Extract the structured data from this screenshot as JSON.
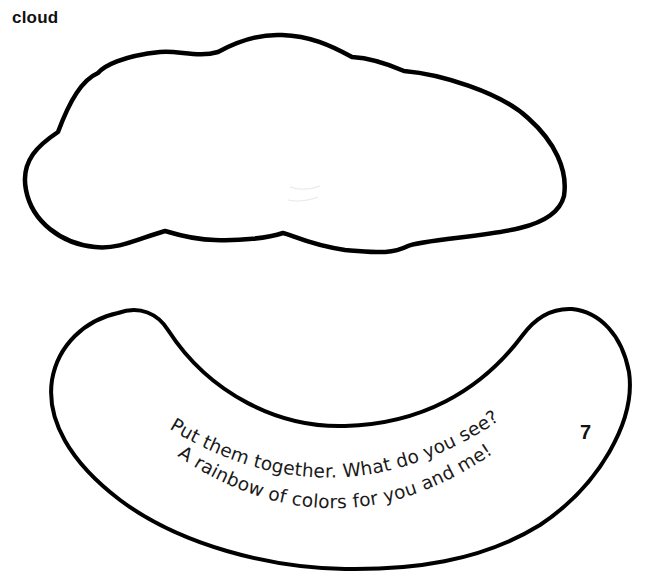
{
  "header": {
    "label": "cloud"
  },
  "pieces": {
    "cloud": {
      "name": "cloud cutout",
      "outline_color": "#000000",
      "fill_color": "#ffffff"
    },
    "rainbow": {
      "name": "rainbow arc cutout",
      "outline_color": "#000000",
      "fill_color": "#ffffff",
      "verse": {
        "line1": "Put them together.  What do you see?",
        "line2": "A rainbow of colors for you and me!"
      }
    }
  },
  "page_number": "7"
}
